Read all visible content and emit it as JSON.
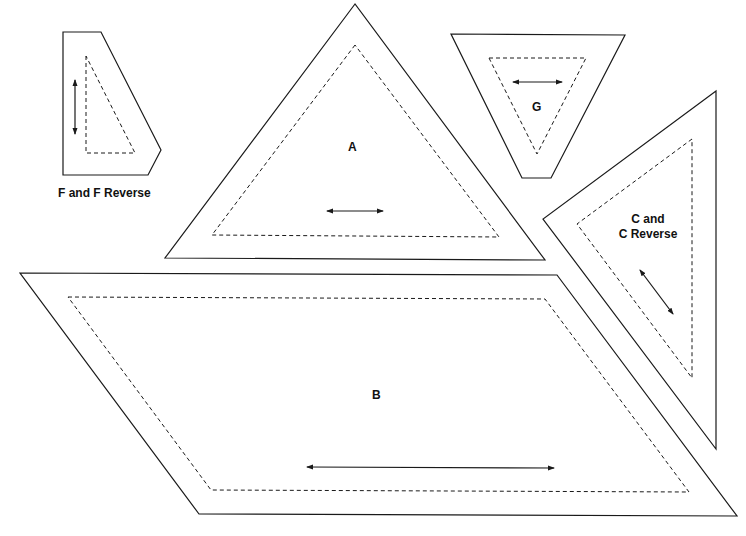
{
  "pieces": {
    "F": {
      "label": "F and F Reverse"
    },
    "A": {
      "label": "A"
    },
    "G": {
      "label": "G"
    },
    "C": {
      "label_line1": "C and",
      "label_line2": "C Reverse"
    },
    "B": {
      "label": "B"
    }
  },
  "legend": {
    "solid_line": "cutting line",
    "dashed_line": "seam line",
    "arrow": "grain direction"
  }
}
